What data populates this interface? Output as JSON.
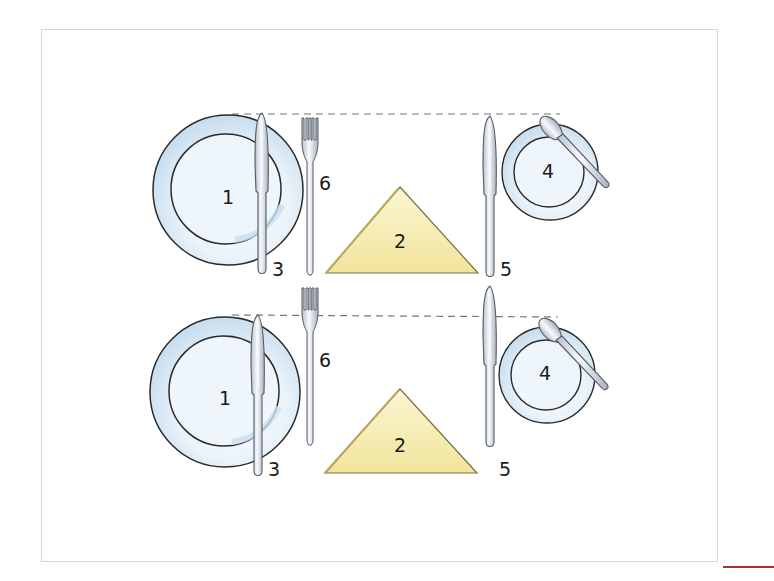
{
  "diagram": {
    "rows": [
      {
        "id": "setting-top",
        "labels": {
          "plate": "1",
          "napkin": "2",
          "knife_left": "3",
          "side_plate": "4",
          "knife_right": "5",
          "fork": "6"
        }
      },
      {
        "id": "setting-bottom",
        "labels": {
          "plate": "1",
          "napkin": "2",
          "knife_left": "3",
          "side_plate": "4",
          "knife_right": "5",
          "fork": "6"
        }
      }
    ],
    "legend_items": [
      {
        "number": "1",
        "item": "dinner plate"
      },
      {
        "number": "2",
        "item": "napkin"
      },
      {
        "number": "3",
        "item": "knife"
      },
      {
        "number": "4",
        "item": "side plate"
      },
      {
        "number": "5",
        "item": "knife"
      },
      {
        "number": "6",
        "item": "fork"
      }
    ],
    "colors": {
      "plate_fill": "#eaf3fa",
      "plate_shade": "#c8dff0",
      "outline": "#2a2a2a",
      "napkin_fill": "#f6eeb4",
      "napkin_edge": "#b8a860",
      "cutlery": "#e4e8ef",
      "guide_line": "#777777",
      "frame": "#d6d6d6",
      "accent_line": "#a3333b"
    }
  }
}
